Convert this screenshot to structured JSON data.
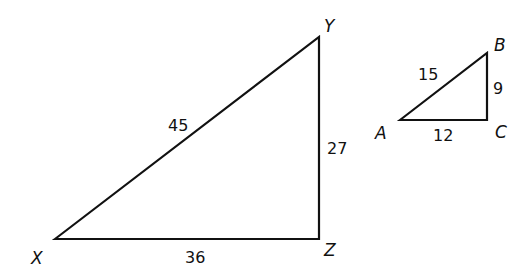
{
  "diagram": {
    "type": "similar-right-triangles",
    "triangles": [
      {
        "name": "XYZ",
        "vertices": {
          "X": "X",
          "Y": "Y",
          "Z": "Z"
        },
        "sides": {
          "XY": "45",
          "YZ": "27",
          "XZ": "36"
        },
        "right_angle_at": "Z"
      },
      {
        "name": "ABC",
        "vertices": {
          "A": "A",
          "B": "B",
          "C": "C"
        },
        "sides": {
          "AB": "15",
          "BC": "9",
          "AC": "12"
        },
        "right_angle_at": "C"
      }
    ],
    "stroke_color": "#111111"
  }
}
